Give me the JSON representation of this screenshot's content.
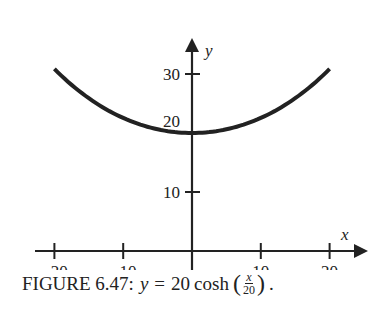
{
  "chart_data": {
    "type": "line",
    "title": "",
    "caption": {
      "prefix": "FIGURE 6.47:",
      "lhs": "y",
      "eq": "=",
      "coef": "20",
      "func": "cosh",
      "frac_num": "x",
      "frac_den": "20",
      "suffix": "."
    },
    "xlabel": "x",
    "ylabel": "y",
    "xlim": [
      -22,
      23
    ],
    "ylim": [
      0,
      35
    ],
    "x_ticks": [
      -20,
      -10,
      10,
      20
    ],
    "x_tick_labels": [
      "−20",
      "−10",
      "10",
      "20"
    ],
    "y_ticks": [
      10,
      20,
      30
    ],
    "y_tick_labels": [
      "10",
      "20",
      "30"
    ],
    "grid": false,
    "series": [
      {
        "name": "y = 20 cosh(x/20)",
        "x": [
          -20,
          -15,
          -10,
          -5,
          0,
          5,
          10,
          15,
          20
        ],
        "y": [
          30.86,
          25.88,
          22.55,
          20.63,
          20,
          20.63,
          22.55,
          25.88,
          30.86
        ]
      }
    ]
  }
}
